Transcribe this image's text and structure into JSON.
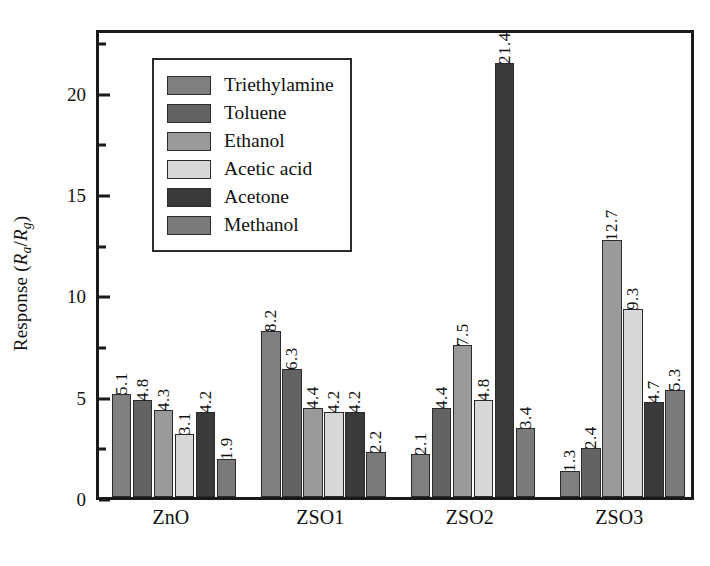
{
  "chart_data": {
    "type": "bar",
    "title": "",
    "xlabel": "",
    "ylabel": "Response (Ra/Rg)",
    "ylabel_parts": {
      "prefix": "Response (",
      "r1": "R",
      "sub1": "a",
      "slash": "/",
      "r2": "R",
      "sub2": "g",
      "suffix": ")"
    },
    "categories": [
      "ZnO",
      "ZSO1",
      "ZSO2",
      "ZSO3"
    ],
    "series": [
      {
        "name": "Triethylamine",
        "color": "#7f7f7f",
        "values": [
          5.1,
          8.2,
          2.1,
          1.3
        ]
      },
      {
        "name": "Toluene",
        "color": "#636363",
        "values": [
          4.8,
          6.3,
          4.4,
          2.4
        ]
      },
      {
        "name": "Ethanol",
        "color": "#9a9a9a",
        "values": [
          4.3,
          4.4,
          7.5,
          12.7
        ]
      },
      {
        "name": "Acetic acid",
        "color": "#d8d8d8",
        "values": [
          3.1,
          4.2,
          4.8,
          9.3
        ]
      },
      {
        "name": "Acetone",
        "color": "#3a3a3a",
        "values": [
          4.2,
          4.2,
          21.4,
          4.7
        ]
      },
      {
        "name": "Methanol",
        "color": "#7a7a7a",
        "values": [
          1.9,
          2.2,
          3.4,
          5.3
        ]
      }
    ],
    "ylim": [
      0,
      23.2
    ],
    "yticks": [
      0,
      5,
      10,
      15,
      20
    ],
    "yticks_minor": [
      2.5,
      7.5,
      12.5,
      17.5,
      22.5
    ],
    "grid": false,
    "legend_position": "upper-left-inside",
    "value_labels": true,
    "value_label_rotation": 90
  },
  "legend": {
    "items": [
      {
        "label": "Triethylamine"
      },
      {
        "label": "Toluene"
      },
      {
        "label": "Ethanol"
      },
      {
        "label": "Acetic acid"
      },
      {
        "label": "Acetone"
      },
      {
        "label": "Methanol"
      }
    ]
  },
  "colors": {
    "axis": "#1a1a1a",
    "background": "#ffffff",
    "text": "#111111"
  }
}
